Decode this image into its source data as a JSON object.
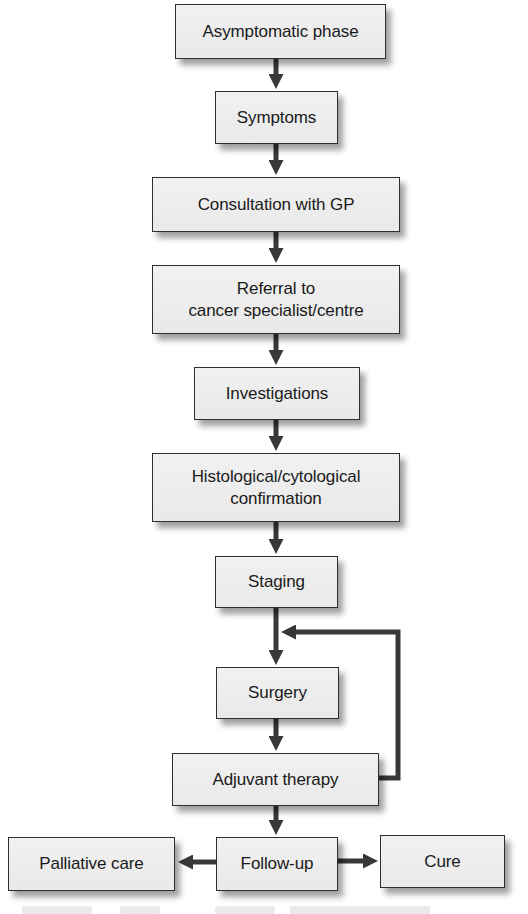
{
  "diagram": {
    "type": "flowchart",
    "colors": {
      "box_fill": "#ececec",
      "box_border": "#2e2e2e",
      "arrow": "#383838",
      "text": "#1a1a1a",
      "background": "#ffffff"
    },
    "nodes": [
      {
        "id": "asymptomatic",
        "lines": [
          "Asymptomatic phase"
        ]
      },
      {
        "id": "symptoms",
        "lines": [
          "Symptoms"
        ]
      },
      {
        "id": "consultation",
        "lines": [
          "Consultation with GP"
        ]
      },
      {
        "id": "referral",
        "lines": [
          "Referral to",
          "cancer specialist/centre"
        ]
      },
      {
        "id": "investigations",
        "lines": [
          "Investigations"
        ]
      },
      {
        "id": "confirmation",
        "lines": [
          "Histological/cytological",
          "confirmation"
        ]
      },
      {
        "id": "staging",
        "lines": [
          "Staging"
        ]
      },
      {
        "id": "surgery",
        "lines": [
          "Surgery"
        ]
      },
      {
        "id": "adjuvant",
        "lines": [
          "Adjuvant therapy"
        ]
      },
      {
        "id": "palliative",
        "lines": [
          "Palliative care"
        ]
      },
      {
        "id": "followup",
        "lines": [
          "Follow-up"
        ]
      },
      {
        "id": "cure",
        "lines": [
          "Cure"
        ]
      }
    ],
    "edges": [
      {
        "from": "asymptomatic",
        "to": "symptoms"
      },
      {
        "from": "symptoms",
        "to": "consultation"
      },
      {
        "from": "consultation",
        "to": "referral"
      },
      {
        "from": "referral",
        "to": "investigations"
      },
      {
        "from": "investigations",
        "to": "confirmation"
      },
      {
        "from": "confirmation",
        "to": "staging"
      },
      {
        "from": "staging",
        "to": "surgery"
      },
      {
        "from": "surgery",
        "to": "adjuvant"
      },
      {
        "from": "adjuvant",
        "to": "surgery",
        "kind": "feedback-loop"
      },
      {
        "from": "adjuvant",
        "to": "followup"
      },
      {
        "from": "followup",
        "to": "palliative"
      },
      {
        "from": "followup",
        "to": "cure"
      }
    ]
  }
}
